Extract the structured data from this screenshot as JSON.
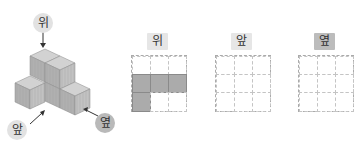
{
  "figure": {
    "structure": {
      "labels": {
        "top": "위",
        "front": "앞",
        "side": "옆"
      }
    },
    "views": [
      {
        "label": "위",
        "highlight": false,
        "cells": [
          [
            0,
            0,
            0
          ],
          [
            1,
            1,
            1
          ],
          [
            1,
            0,
            0
          ]
        ]
      },
      {
        "label": "앞",
        "highlight": false,
        "cells": [
          [
            0,
            0,
            0
          ],
          [
            0,
            0,
            0
          ],
          [
            0,
            0,
            0
          ]
        ]
      },
      {
        "label": "옆",
        "highlight": true,
        "cells": [
          [
            0,
            0,
            0
          ],
          [
            0,
            0,
            0
          ],
          [
            0,
            0,
            0
          ]
        ]
      }
    ],
    "colors": {
      "cube_top": "#cfcfcf",
      "cube_left": "#a9a9a9",
      "cube_right": "#bdbdbd",
      "grid_fill": "#ababab",
      "label_bg": "#e6e6e6",
      "label_bg_highlight": "#bcbcbc"
    }
  }
}
